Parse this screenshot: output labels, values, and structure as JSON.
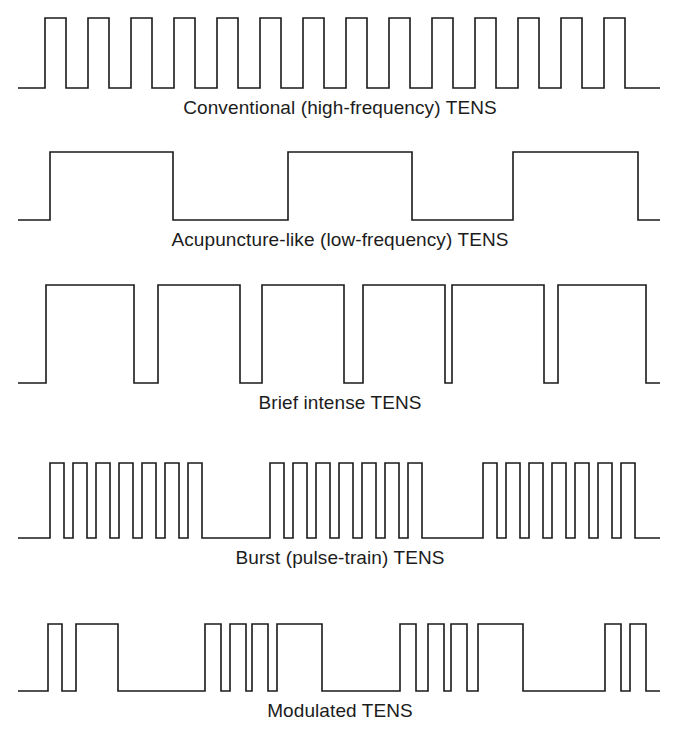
{
  "figure": {
    "background_color": "#ffffff",
    "line_color": "#1a1a1a",
    "width": 680,
    "height": 741
  },
  "chart_data": {
    "type": "line",
    "subtitle": "",
    "xlabel": "",
    "ylabel": "",
    "grid": false,
    "legend": "none",
    "axis_style": "baseline-only",
    "series": [
      {
        "name": "Conventional (high-frequency) TENS",
        "index": 0,
        "baseline_y": 97,
        "baseline_x_start": 18,
        "baseline_x_end": 660,
        "pulse_height": 70,
        "pulse_count": 14,
        "pulse_width": 21,
        "pulse_gap": 22,
        "pattern": "uniform narrow pulses, evenly spaced, high repetition rate",
        "pulse_starts": [
          45,
          88,
          131,
          174,
          217,
          260,
          303,
          346,
          389,
          432,
          475,
          518,
          561,
          604
        ],
        "pulse_widths": [
          21,
          21,
          21,
          21,
          21,
          21,
          21,
          21,
          21,
          21,
          21,
          21,
          21,
          21
        ]
      },
      {
        "name": "Acupuncture-like (low-frequency) TENS",
        "index": 1,
        "baseline_y": 229,
        "baseline_x_start": 18,
        "baseline_x_end": 660,
        "pulse_height": 68,
        "pulse_count": 3,
        "pattern": "wide long-duration pulses, widely spaced, low repetition rate",
        "pulse_starts": [
          50,
          288,
          513
        ],
        "pulse_widths": [
          123,
          124,
          125
        ]
      },
      {
        "name": "Brief intense TENS",
        "index": 2,
        "baseline_y": 392,
        "baseline_x_start": 18,
        "baseline_x_end": 660,
        "pulse_height": 98,
        "pulse_count": 6,
        "pattern": "tall wide pulses with narrow gaps, high amplitude and long duration",
        "pulse_starts": [
          46,
          158,
          262,
          363,
          452,
          558
        ],
        "pulse_widths": [
          88,
          82,
          82,
          82,
          92,
          88
        ]
      },
      {
        "name": "Burst (pulse-train) TENS",
        "index": 3,
        "baseline_y": 547,
        "baseline_x_start": 18,
        "baseline_x_end": 660,
        "pulse_height": 75,
        "burst_count": 3,
        "pulses_per_burst": 7,
        "pattern": "three bursts, each containing seven narrow pulses, separated by silent intervals",
        "pulse_starts": [
          50,
          73,
          96,
          119,
          142,
          165,
          188,
          270,
          293,
          316,
          339,
          362,
          385,
          408,
          483,
          506,
          529,
          552,
          575,
          598,
          621
        ],
        "pulse_widths": [
          14,
          14,
          14,
          14,
          14,
          14,
          14,
          14,
          14,
          14,
          14,
          14,
          14,
          14,
          14,
          14,
          14,
          14,
          14,
          14,
          14
        ]
      },
      {
        "name": "Modulated TENS",
        "index": 4,
        "baseline_y": 700,
        "baseline_x_start": 18,
        "baseline_x_end": 660,
        "pulse_height": 67,
        "group_count": 4,
        "pattern": "groups of pulses with varying width and spacing, amplitude and duration modulated over time",
        "pulse_starts": [
          48,
          76,
          205,
          230,
          252,
          277,
          400,
          428,
          451,
          478,
          605,
          630
        ],
        "pulse_widths": [
          14,
          42,
          16,
          16,
          16,
          45,
          16,
          16,
          16,
          45,
          16,
          16
        ]
      }
    ]
  },
  "captions": [
    {
      "label": "Conventional (high-frequency) TENS",
      "y": 107
    },
    {
      "label": "Acupuncture-like (low-frequency) TENS",
      "y": 239
    },
    {
      "label": "Brief intense TENS",
      "y": 402
    },
    {
      "label": "Burst (pulse-train) TENS",
      "y": 557
    },
    {
      "label": "Modulated TENS",
      "y": 710
    }
  ]
}
